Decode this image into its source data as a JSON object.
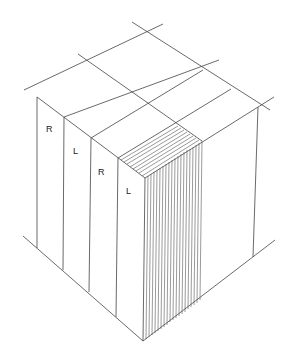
{
  "diagram": {
    "title": "",
    "stroke_color": "#444444",
    "background": "#ffffff",
    "layer_labels": [
      {
        "text": "R",
        "x": 49,
        "y": 132
      },
      {
        "text": "L",
        "x": 76,
        "y": 154
      },
      {
        "text": "R",
        "x": 101,
        "y": 175
      },
      {
        "text": "L",
        "x": 128,
        "y": 194
      }
    ],
    "hatch_count": 20
  }
}
